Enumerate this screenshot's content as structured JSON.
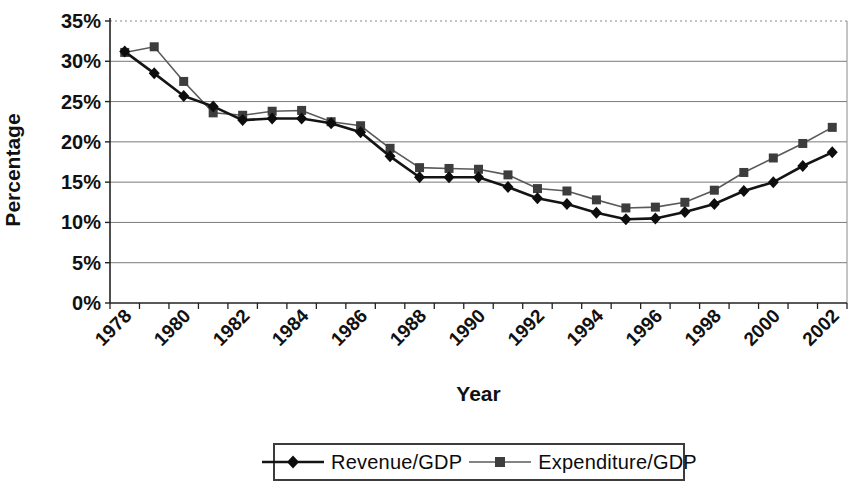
{
  "chart_data": {
    "type": "line",
    "title": "",
    "xlabel": "Year",
    "ylabel": "Percentage",
    "ylim": [
      0,
      35
    ],
    "y_ticks": [
      0,
      5,
      10,
      15,
      20,
      25,
      30,
      35
    ],
    "y_tick_labels": [
      "0%",
      "5%",
      "10%",
      "15%",
      "20%",
      "25%",
      "30%",
      "35%"
    ],
    "x_tick_label_every": 2,
    "grid": "horizontal gridlines on; top (35%) gridline dotted; plot area right border shown",
    "legend_position": "bottom-center, boxed",
    "categories": [
      "1978",
      "1979",
      "1980",
      "1981",
      "1982",
      "1983",
      "1984",
      "1985",
      "1986",
      "1987",
      "1988",
      "1989",
      "1990",
      "1991",
      "1992",
      "1993",
      "1994",
      "1995",
      "1996",
      "1997",
      "1998",
      "1999",
      "2000",
      "2001",
      "2002"
    ],
    "series": [
      {
        "name": "Revenue/GDP",
        "marker": "diamond",
        "color": "#141414",
        "marker_color": "#0d0d0d",
        "line_width": 2.6,
        "values": [
          31.2,
          28.5,
          25.7,
          24.4,
          22.7,
          22.9,
          22.9,
          22.3,
          21.2,
          18.2,
          15.6,
          15.6,
          15.6,
          14.4,
          13.0,
          12.3,
          11.2,
          10.4,
          10.5,
          11.3,
          12.3,
          13.9,
          15.0,
          17.0,
          18.7
        ]
      },
      {
        "name": "Expenditure/GDP",
        "marker": "square",
        "color": "#5a5a5a",
        "marker_color": "#3d3d3d",
        "line_width": 1.6,
        "values": [
          31.1,
          31.8,
          27.5,
          23.6,
          23.3,
          23.8,
          23.9,
          22.5,
          22.0,
          19.2,
          16.8,
          16.7,
          16.6,
          15.9,
          14.2,
          13.9,
          12.8,
          11.8,
          11.9,
          12.5,
          14.0,
          16.2,
          18.0,
          19.8,
          21.8
        ]
      }
    ],
    "axis_color": "#222222",
    "gridline_color": "#7a7a7a"
  }
}
